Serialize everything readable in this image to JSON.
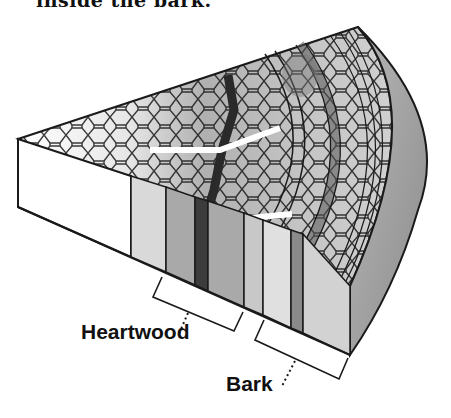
{
  "caption": {
    "text": "inside the bark."
  },
  "labels": {
    "heartwood": "Heartwood",
    "bark": "Bark"
  },
  "diagram": {
    "colors": {
      "outline": "#1a1a1a",
      "pith_cells": "#ffffff",
      "sapwood_light": "#d8d8d8",
      "heartwood_mid": "#a8a8a8",
      "dark_ray": "#3a3a3a",
      "bark_side": "#9a9a9a",
      "front_blank": "#ffffff"
    },
    "front_strips": [
      {
        "name": "blank",
        "x0": 18,
        "x1": 131,
        "fill": "#ffffff"
      },
      {
        "name": "light",
        "x0": 131,
        "x1": 166,
        "fill": "#d9d9d9"
      },
      {
        "name": "mid",
        "x0": 166,
        "x1": 195,
        "fill": "#a9a9a9"
      },
      {
        "name": "dark",
        "x0": 195,
        "x1": 208,
        "fill": "#3c3c3c"
      },
      {
        "name": "mid2",
        "x0": 208,
        "x1": 244,
        "fill": "#a9a9a9"
      },
      {
        "name": "light2",
        "x0": 244,
        "x1": 263,
        "fill": "#c8c8c8"
      },
      {
        "name": "light3",
        "x0": 263,
        "x1": 291,
        "fill": "#e0e0e0"
      },
      {
        "name": "dark2",
        "x0": 291,
        "x1": 303,
        "fill": "#8a8a8a"
      },
      {
        "name": "light4",
        "x0": 303,
        "x1": 350,
        "fill": "#d2d2d2"
      }
    ]
  }
}
